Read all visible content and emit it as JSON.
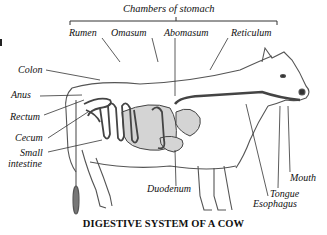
{
  "diagram": {
    "title": "DIGESTIVE SYSTEM OF A COW",
    "group_label": "Chambers of stomach",
    "stomach_chambers": [
      {
        "label": "Rumen"
      },
      {
        "label": "Omasum"
      },
      {
        "label": "Abomasum"
      },
      {
        "label": "Reticulum"
      }
    ],
    "left_labels": [
      {
        "label": "Colon"
      },
      {
        "label": "Anus"
      },
      {
        "label": "Rectum"
      },
      {
        "label": "Cecum"
      },
      {
        "label": "Small intestine",
        "line1": "Small",
        "line2": "intestine"
      }
    ],
    "right_labels": [
      {
        "label": "Mouth"
      },
      {
        "label": "Tongue"
      },
      {
        "label": "Esophagus"
      }
    ],
    "bottom_labels": [
      {
        "label": "Duodenum"
      }
    ],
    "colors": {
      "line": "#222222",
      "organ_fill": "#d4d4d4",
      "body_outline": "#555555",
      "background": "#ffffff"
    }
  }
}
